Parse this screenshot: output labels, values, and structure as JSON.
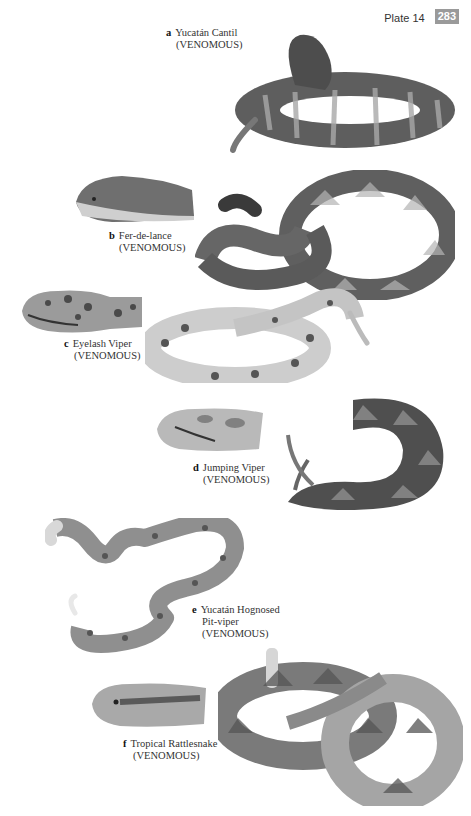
{
  "header": {
    "plate_label": "Plate 14",
    "page_number": "283"
  },
  "species": [
    {
      "letter": "a",
      "name": "Yucatán Cantil",
      "name_line2": "",
      "status": "(VENOMOUS)"
    },
    {
      "letter": "b",
      "name": "Fer-de-lance",
      "name_line2": "",
      "status": "(VENOMOUS)"
    },
    {
      "letter": "c",
      "name": "Eyelash Viper",
      "name_line2": "",
      "status": "(VENOMOUS)"
    },
    {
      "letter": "d",
      "name": "Jumping Viper",
      "name_line2": "",
      "status": "(VENOMOUS)"
    },
    {
      "letter": "e",
      "name": "Yucatán Hognosed",
      "name_line2": "Pit-viper",
      "status": "(VENOMOUS)"
    },
    {
      "letter": "f",
      "name": "Tropical Rattlesnake",
      "name_line2": "",
      "status": "(VENOMOUS)"
    }
  ],
  "colors": {
    "page_number_bg": "#9a9a9a",
    "snake_dark": "#4a4a4a",
    "snake_mid": "#8a8a8a",
    "snake_light": "#c8c8c8"
  }
}
